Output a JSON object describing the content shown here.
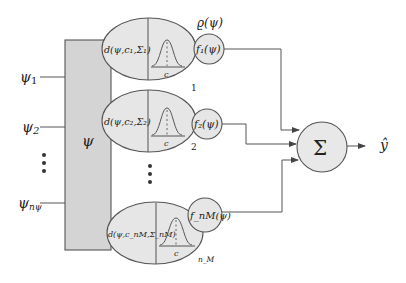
{
  "diagram": {
    "title": "",
    "input_block": {
      "label": "ψ",
      "inputs": [
        {
          "label": "ψ",
          "sub": "1"
        },
        {
          "label": "ψ",
          "sub": "2"
        },
        {
          "label": "ψ",
          "sub": "nψ"
        }
      ],
      "ellipsis": "⋮"
    },
    "rules": [
      {
        "distance_label": "d(ψ,c₁,Σ₁)",
        "center_label": "c",
        "output_label": "f₁(ψ)",
        "index_label": "1"
      },
      {
        "distance_label": "d(ψ,c₂,Σ₂)",
        "center_label": "c",
        "output_label": "f₂(ψ)",
        "index_label": "2"
      },
      {
        "distance_label": "d(ψ,c_nM,Σ_nM)",
        "center_label": "c",
        "output_label": "f_nM(ψ)",
        "index_label": "n_M"
      }
    ],
    "rules_ellipsis": "⋮",
    "rho_label": "ϱ(ψ)",
    "sum_node": {
      "label": "Σ"
    },
    "output": {
      "label": "ŷ"
    }
  }
}
